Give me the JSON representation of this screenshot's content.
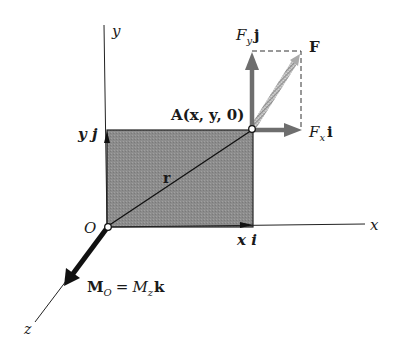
{
  "diagram": {
    "type": "moment-of-force-about-point",
    "colors": {
      "plate_fill": "#8a8a8a",
      "axis": "#222222",
      "force_arrow": "#6e6e6e",
      "resultant_arrow": "#bdbdbd",
      "moment_arrow": "#111111"
    },
    "axes": {
      "x_label": "x",
      "y_label": "y",
      "z_label": "z"
    },
    "points": {
      "origin_label": "O",
      "point_A_label": "A(x, y, 0)"
    },
    "vectors": {
      "position": "r",
      "x_component": "x i",
      "y_component": "y j",
      "force": "F",
      "force_x": {
        "base": "F",
        "sub": "x",
        "unit": "i"
      },
      "force_y": {
        "base": "F",
        "sub": "y",
        "unit": "j"
      },
      "moment": {
        "lhs": "M",
        "lhs_sub": "O",
        "eq": "=",
        "rhs": "M",
        "rhs_sub": "z",
        "unit": "k"
      }
    }
  }
}
